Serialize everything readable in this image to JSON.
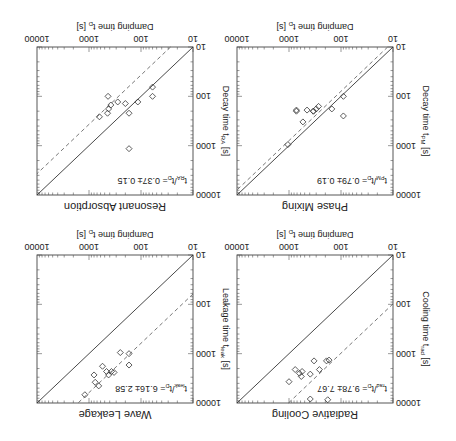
{
  "figure": {
    "orientation": "rotated 180 degrees",
    "x_axis_label": "Damping time  t_D [s]",
    "tick_labels": [
      "10",
      "100",
      "1000",
      "10000"
    ]
  },
  "chart_data": [
    {
      "type": "scatter",
      "title": "Radiative Cooling",
      "xlabel": "Damping time  t_D [s]",
      "ylabel": "Cooling time  t_rad [s]",
      "annotation": "t_rad/t_D = 9.78 ± 7.67",
      "ratio": 9.78,
      "xlim": [
        10,
        10000
      ],
      "ylim": [
        10,
        10000
      ],
      "scale": "log-log",
      "lines": [
        "solid: y = x",
        "dashed: y = 9.78 x"
      ],
      "points": [
        {
          "x": 170,
          "y": 1350
        },
        {
          "x": 190,
          "y": 1400
        },
        {
          "x": 260,
          "y": 2100
        },
        {
          "x": 330,
          "y": 1400
        },
        {
          "x": 390,
          "y": 2600
        },
        {
          "x": 560,
          "y": 2300
        },
        {
          "x": 580,
          "y": 2900
        },
        {
          "x": 630,
          "y": 2500
        },
        {
          "x": 760,
          "y": 2100
        },
        {
          "x": 1000,
          "y": 3700
        },
        {
          "x": 390,
          "y": 8300
        },
        {
          "x": 180,
          "y": 8600
        }
      ]
    },
    {
      "type": "scatter",
      "title": "Wave Leakage",
      "xlabel": "Damping time  t_D [s]",
      "ylabel": "Leakage time  t_leak [s]",
      "annotation": "t_leak/t_D = 6.16 ± 2.58",
      "ratio": 6.16,
      "xlim": [
        10,
        10000
      ],
      "ylim": [
        10,
        10000
      ],
      "scale": "log-log",
      "lines": [
        "solid: y = x",
        "dashed: y = 6.16 x"
      ],
      "points": [
        {
          "x": 170,
          "y": 1000
        },
        {
          "x": 170,
          "y": 1700
        },
        {
          "x": 250,
          "y": 950
        },
        {
          "x": 330,
          "y": 2400
        },
        {
          "x": 370,
          "y": 2300
        },
        {
          "x": 420,
          "y": 2700
        },
        {
          "x": 460,
          "y": 2300
        },
        {
          "x": 550,
          "y": 1800
        },
        {
          "x": 650,
          "y": 4500
        },
        {
          "x": 760,
          "y": 3800
        },
        {
          "x": 800,
          "y": 2700
        },
        {
          "x": 1200,
          "y": 6800
        }
      ]
    },
    {
      "type": "scatter",
      "title": "Phase Mixing",
      "xlabel": "Damping time  t_D [s]",
      "ylabel": "Decay time  t_PM [s]",
      "annotation": "t_PM/t_D = 0.79 ± 0.19",
      "ratio": 0.79,
      "xlim": [
        10,
        10000
      ],
      "ylim": [
        10,
        10000
      ],
      "scale": "log-log",
      "lines": [
        "solid: y = x",
        "dashed: y = 0.79 x"
      ],
      "points": [
        {
          "x": 90,
          "y": 100
        },
        {
          "x": 90,
          "y": 250
        },
        {
          "x": 150,
          "y": 180
        },
        {
          "x": 270,
          "y": 160
        },
        {
          "x": 300,
          "y": 180
        },
        {
          "x": 340,
          "y": 200
        },
        {
          "x": 340,
          "y": 200
        },
        {
          "x": 450,
          "y": 190
        },
        {
          "x": 540,
          "y": 330
        },
        {
          "x": 720,
          "y": 190
        },
        {
          "x": 720,
          "y": 200
        },
        {
          "x": 1050,
          "y": 950
        }
      ]
    },
    {
      "type": "scatter",
      "title": "Resonant Absorption",
      "xlabel": "Damping time  t_D [s]",
      "ylabel": "Decay time  t_RA [s]",
      "annotation": "t_RA/t_D = 0.37 ± 0.15",
      "ratio": 0.37,
      "xlim": [
        10,
        10000
      ],
      "ylim": [
        10,
        10000
      ],
      "scale": "log-log",
      "lines": [
        "solid: y = x",
        "dashed: y = 0.37 x"
      ],
      "points": [
        {
          "x": 60,
          "y": 65
        },
        {
          "x": 60,
          "y": 100
        },
        {
          "x": 115,
          "y": 130
        },
        {
          "x": 170,
          "y": 220
        },
        {
          "x": 170,
          "y": 1150
        },
        {
          "x": 200,
          "y": 140
        },
        {
          "x": 280,
          "y": 130
        },
        {
          "x": 380,
          "y": 150
        },
        {
          "x": 420,
          "y": 180
        },
        {
          "x": 430,
          "y": 100
        },
        {
          "x": 440,
          "y": 220
        },
        {
          "x": 630,
          "y": 260
        }
      ]
    }
  ],
  "panels": [
    {
      "title": "Radiative Cooling",
      "ylabel_main": "Cooling time  t",
      "ylabel_sub": "rad",
      "ylabel_unit": " [s]",
      "ann_pre": "t",
      "ann_sub": "rad",
      "ann_post": "/t",
      "ann_sub2": "D",
      "ann_val": "= 9.78± 7.67"
    },
    {
      "title": "Wave Leakage",
      "ylabel_main": "Leakage time  t",
      "ylabel_sub": "leak",
      "ylabel_unit": " [s]",
      "ann_pre": "t",
      "ann_sub": "leak",
      "ann_post": "/t",
      "ann_sub2": "D",
      "ann_val": "= 6.16± 2.58"
    },
    {
      "title": "Phase Mixing",
      "ylabel_main": "Decay time  t",
      "ylabel_sub": "PM",
      "ylabel_unit": " [s]",
      "ann_pre": "t",
      "ann_sub": "PM",
      "ann_post": "/t",
      "ann_sub2": "D",
      "ann_val": "= 0.79± 0.19"
    },
    {
      "title": "Resonant Absorption",
      "ylabel_main": "Decay time  t",
      "ylabel_sub": "RA",
      "ylabel_unit": " [s]",
      "ann_pre": "t",
      "ann_sub": "RA",
      "ann_post": "/t",
      "ann_sub2": "D",
      "ann_val": "= 0.37± 0.15"
    }
  ],
  "x_label_main": "Damping time  t",
  "x_label_sub": "D",
  "x_label_unit": " [s]"
}
